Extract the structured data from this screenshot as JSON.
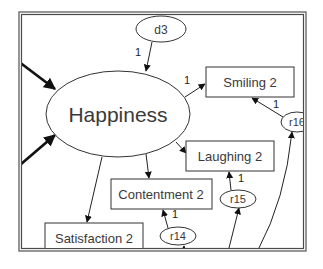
{
  "diagram": {
    "type": "structural-equation-model",
    "latent_variables": [
      {
        "id": "happiness",
        "label": "Happiness"
      }
    ],
    "disturbances": [
      {
        "id": "d3",
        "label": "d3",
        "path_weight": "1",
        "target": "happiness"
      }
    ],
    "observed_variables": [
      {
        "id": "smiling2",
        "label": "Smiling 2"
      },
      {
        "id": "laughing2",
        "label": "Laughing 2"
      },
      {
        "id": "contentment2",
        "label": "Contentment 2"
      },
      {
        "id": "satisfaction2",
        "label": "Satisfaction 2"
      }
    ],
    "residuals": [
      {
        "id": "r16",
        "label": "r16",
        "target": "smiling2"
      },
      {
        "id": "r15",
        "label": "r15",
        "target": "laughing2"
      },
      {
        "id": "r14",
        "label": "r14",
        "target": "contentment2"
      }
    ],
    "paths": [
      {
        "from": "d3",
        "to": "happiness",
        "weight": "1"
      },
      {
        "from": "happiness",
        "to": "smiling2",
        "weight": "1"
      },
      {
        "from": "happiness",
        "to": "laughing2",
        "weight": ""
      },
      {
        "from": "happiness",
        "to": "contentment2",
        "weight": ""
      },
      {
        "from": "happiness",
        "to": "satisfaction2",
        "weight": ""
      },
      {
        "from": "r16",
        "to": "smiling2",
        "weight": "1"
      },
      {
        "from": "r15",
        "to": "laughing2",
        "weight": "1"
      },
      {
        "from": "r14",
        "to": "contentment2",
        "weight": "1"
      },
      {
        "from": "offscreen-left-1",
        "to": "happiness",
        "weight": ""
      },
      {
        "from": "offscreen-left-2",
        "to": "happiness",
        "weight": ""
      },
      {
        "from": "offscreen-bottom",
        "to": "r14",
        "weight": ""
      },
      {
        "from": "offscreen-bottom",
        "to": "r15",
        "weight": ""
      },
      {
        "from": "offscreen-bottom",
        "to": "r16",
        "weight": ""
      }
    ]
  }
}
